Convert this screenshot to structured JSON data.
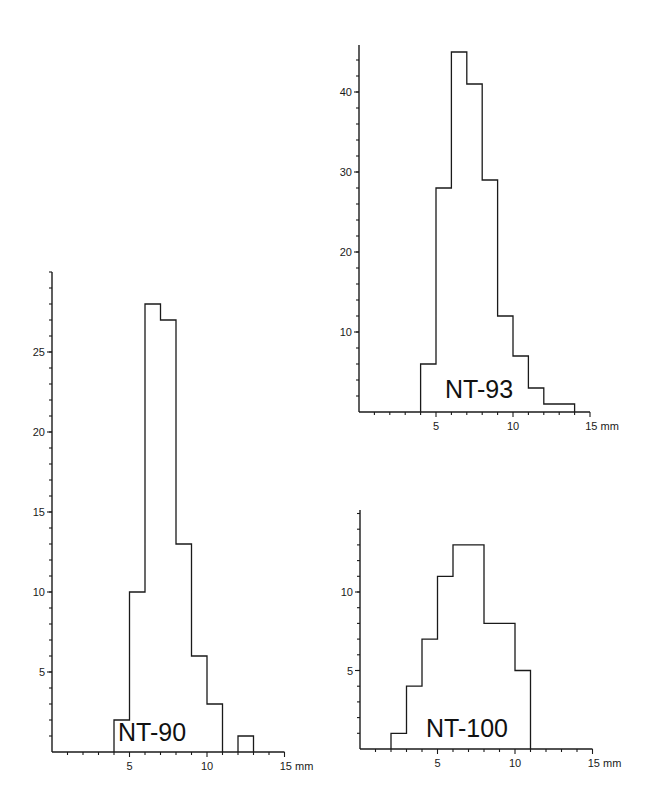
{
  "chart_data": [
    {
      "type": "bar",
      "title": "NT-90",
      "xlabel": "mm",
      "ylabel": "",
      "bin_edges": [
        4,
        5,
        6,
        7,
        8,
        9,
        10,
        11,
        12,
        13
      ],
      "categories": [
        "4-5",
        "5-6",
        "6-7",
        "7-8",
        "8-9",
        "9-10",
        "10-11",
        "11-12",
        "12-13"
      ],
      "values": [
        2,
        10,
        28,
        27,
        13,
        6,
        3,
        0,
        1
      ],
      "x_ticks": [
        5,
        10,
        15
      ],
      "x_tick_labels": [
        "5",
        "10",
        "15 mm"
      ],
      "y_ticks": [
        5,
        10,
        15,
        20,
        25
      ],
      "xlim": [
        0,
        15
      ],
      "ylim": [
        0,
        29
      ],
      "grid": false,
      "layout": {
        "x0": 52,
        "y0": 752,
        "px_per_x": 15.5,
        "px_per_y": 16,
        "ytop": 272,
        "label_x": 118,
        "label_y": 741
      }
    },
    {
      "type": "bar",
      "title": "NT-93",
      "xlabel": "mm",
      "ylabel": "",
      "bin_edges": [
        4,
        5,
        6,
        7,
        8,
        9,
        10,
        11,
        12,
        13,
        14
      ],
      "categories": [
        "4-5",
        "5-6",
        "6-7",
        "7-8",
        "8-9",
        "9-10",
        "10-11",
        "11-12",
        "12-13",
        "13-14"
      ],
      "values": [
        6,
        28,
        45,
        41,
        29,
        12,
        7,
        3,
        1,
        1
      ],
      "x_ticks": [
        5,
        10,
        15
      ],
      "x_tick_labels": [
        "5",
        "10",
        "15 mm"
      ],
      "y_ticks": [
        10,
        20,
        30,
        40
      ],
      "xlim": [
        0,
        15
      ],
      "ylim": [
        0,
        47
      ],
      "grid": false,
      "layout": {
        "x0": 359,
        "y0": 412,
        "px_per_x": 15.4,
        "px_per_y": 8.0,
        "ytop": 45,
        "label_x": 445,
        "label_y": 398
      }
    },
    {
      "type": "bar",
      "title": "NT-100",
      "xlabel": "mm",
      "ylabel": "",
      "bin_edges": [
        2,
        3,
        4,
        5,
        6,
        7,
        8,
        9,
        10,
        11
      ],
      "categories": [
        "2-3",
        "3-4",
        "4-5",
        "5-6",
        "6-7",
        "7-8",
        "8-9",
        "9-10",
        "10-11"
      ],
      "values": [
        1,
        4,
        7,
        11,
        13,
        13,
        8,
        8,
        5
      ],
      "x_ticks": [
        5,
        10,
        15
      ],
      "x_tick_labels": [
        "5",
        "10",
        "15 mm"
      ],
      "y_ticks": [
        5,
        10
      ],
      "xlim": [
        0,
        15
      ],
      "ylim": [
        0,
        15
      ],
      "grid": false,
      "layout": {
        "x0": 360,
        "y0": 749,
        "px_per_x": 15.5,
        "px_per_y": 15.7,
        "ytop": 510,
        "label_x": 426,
        "label_y": 737
      }
    }
  ]
}
